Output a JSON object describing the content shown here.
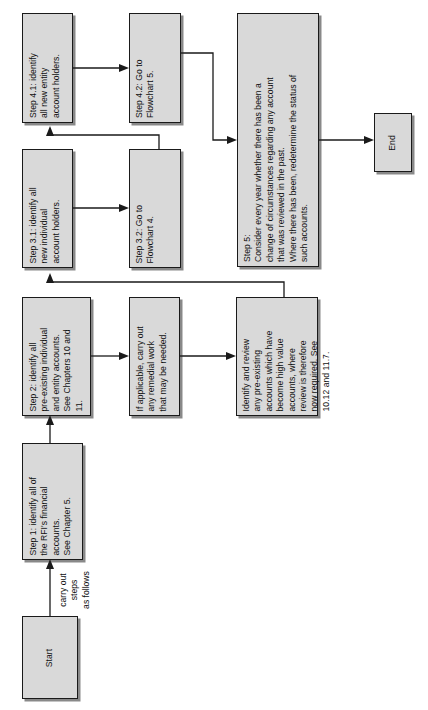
{
  "diagram": {
    "title": "Flowchart",
    "orientation": "rotated-90-ccw",
    "box_fill": "#d9d9d9",
    "box_border": "#1a1a1a",
    "page_background": "#ffffff"
  },
  "nodes": {
    "start": {
      "label": "Start",
      "x": 22,
      "y": 616,
      "w": 56,
      "h": 83
    },
    "step1": {
      "label": "Step 1: identify all of\nthe RFI's financial\naccounts.\nSee Chapter 5.",
      "x": 22,
      "y": 443,
      "w": 61,
      "h": 117
    },
    "step2": {
      "label": "Step 2: identify all\npre-existing individual\nand entity accounts.\nSee Chapters 10 and\n11.",
      "x": 22,
      "y": 297,
      "w": 69,
      "h": 119
    },
    "remedial": {
      "label": "If applicable, carry out\nany remedial work\nthat may be needed.",
      "x": 129,
      "y": 297,
      "w": 51,
      "h": 119
    },
    "review": {
      "label": "Identify and review\nany pre-existing\naccounts which have\nbecome high value\naccounts, where\nreview is therefore\nnow required. See\n10.12 and 11.7.",
      "x": 236,
      "y": 297,
      "w": 82,
      "h": 119
    },
    "step31": {
      "label": "Step 3.1: identify all\nnew individual\naccount holders.",
      "x": 22,
      "y": 149,
      "w": 51,
      "h": 119
    },
    "step32": {
      "label": "Step 3.2: Go to\nFlowchart 4.",
      "x": 129,
      "y": 149,
      "w": 52,
      "h": 119
    },
    "step41": {
      "label": "Step 4.1: identify\nall new entity\naccount holders.",
      "x": 22,
      "y": 13,
      "w": 51,
      "h": 110
    },
    "step42": {
      "label": "Step 4.2: Go to\nFlowchart 5.",
      "x": 129,
      "y": 13,
      "w": 52,
      "h": 110
    },
    "step5": {
      "label": "Step 5:\nConsider every year whether there has been a\nchange of circumstances regarding any account\nthat was reviewed in the past.\nWhere there has been, redetermine the status of\nsuch accounts.",
      "x": 237,
      "y": 13,
      "w": 82,
      "h": 254
    },
    "end": {
      "label": "End",
      "x": 374,
      "y": 113,
      "w": 38,
      "h": 59
    }
  },
  "labels": {
    "start_to_step1": "carry out steps\nas follows"
  },
  "connectors": [
    {
      "name": "start-to-step1",
      "from": "start",
      "to": "step1"
    },
    {
      "name": "step1-to-step2",
      "from": "step1",
      "to": "step2"
    },
    {
      "name": "step2-to-remedial",
      "from": "step2",
      "to": "remedial"
    },
    {
      "name": "remedial-to-review",
      "from": "remedial",
      "to": "review"
    },
    {
      "name": "review-to-step31",
      "from": "review",
      "to": "step31"
    },
    {
      "name": "step31-to-step32",
      "from": "step31",
      "to": "step32"
    },
    {
      "name": "step32-to-step41",
      "from": "step32",
      "to": "step41"
    },
    {
      "name": "step41-to-step42",
      "from": "step41",
      "to": "step42"
    },
    {
      "name": "step42-to-step5",
      "from": "step42",
      "to": "step5"
    },
    {
      "name": "step5-to-end",
      "from": "step5",
      "to": "end"
    }
  ]
}
